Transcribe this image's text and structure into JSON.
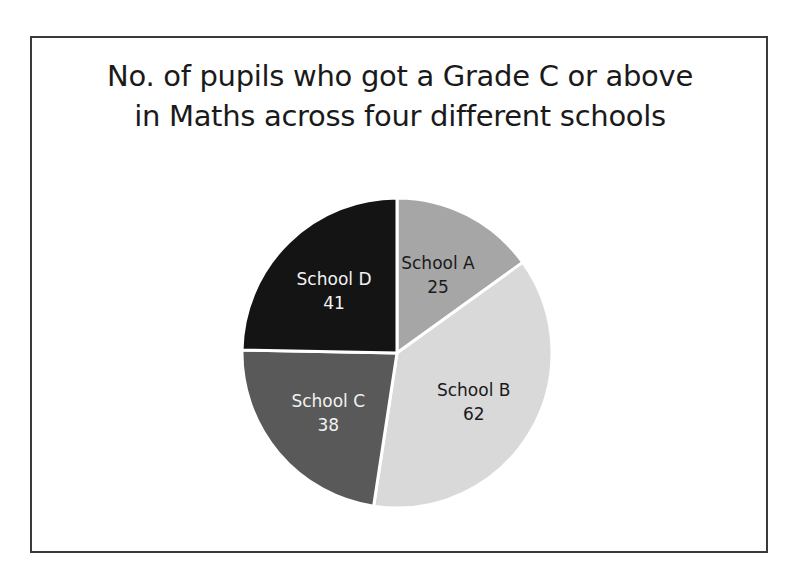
{
  "chart_data": {
    "type": "pie",
    "title": "No. of pupils who got a Grade C or above in Maths across four different schools",
    "title_lines": [
      "No. of pupils who got a Grade C or above",
      "in Maths across four different schools"
    ],
    "categories": [
      "School A",
      "School B",
      "School C",
      "School D"
    ],
    "values": [
      25,
      62,
      38,
      41
    ],
    "colors": [
      "#a6a6a6",
      "#d9d9d9",
      "#595959",
      "#141414"
    ],
    "label_colors": [
      "#1a1a1a",
      "#1a1a1a",
      "#f2f2f2",
      "#f2f2f2"
    ],
    "data_labels": [
      "School A\n25",
      "School B\n62",
      "School C\n38",
      "School D\n41"
    ],
    "start_angle_deg": 0,
    "direction": "clockwise",
    "legend": "none",
    "grid": false
  }
}
